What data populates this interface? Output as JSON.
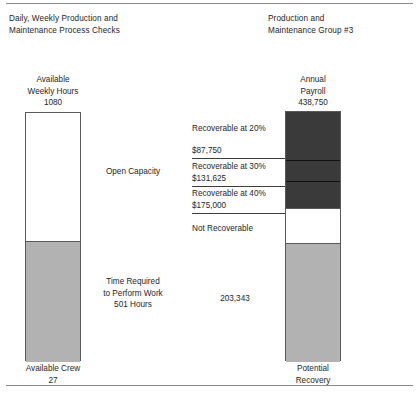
{
  "header": {
    "left_title": "Daily, Weekly Production and\nMaintenance Process Checks",
    "right_title": "Production and\nMaintenance Group #3"
  },
  "left_chart": {
    "top_caption": "Available\nWeekly Hours\n1080",
    "bottom_caption": "Available Crew\n27",
    "segments": [
      {
        "label": "Open Capacity",
        "fill": "#ffffff"
      },
      {
        "label": "Time Required\nto Perform Work\n501 Hours",
        "fill": "#b2b2b2"
      }
    ]
  },
  "right_chart": {
    "top_caption": "Annual\nPayroll\n438,750",
    "bottom_caption": "Potential\nRecovery",
    "inner_value": "203,343",
    "segments": [
      {
        "label": "Recoverable at 20%",
        "value": "$87,750",
        "fill": "#3a3a3a"
      },
      {
        "label": "Recoverable at 30%",
        "value": "$131,625",
        "fill": "#3a3a3a"
      },
      {
        "label": "Recoverable at 40%",
        "value": "$175,000",
        "fill": "#3a3a3a"
      },
      {
        "label": "Not Recoverable",
        "value": "",
        "fill": "#ffffff"
      },
      {
        "label": "",
        "value": "203,343",
        "fill": "#b2b2b2"
      }
    ]
  },
  "chart_data": {
    "type": "bar",
    "title": "Daily, Weekly Production and Maintenance Process Checks",
    "subtitle": "Production and Maintenance Group #3",
    "xlabel": "",
    "ylabel": "",
    "grid": false,
    "legend": "none",
    "series": [
      {
        "name": "Available Weekly Hours",
        "total": 1080,
        "total_label": "1080",
        "axis_caption_top": "Available Weekly Hours 1080",
        "axis_caption_bottom": "Available Crew 27",
        "crew": 27,
        "segments": [
          {
            "name": "Open Capacity",
            "value": 579,
            "color": "#ffffff"
          },
          {
            "name": "Time Required to Perform Work",
            "value": 501,
            "label": "501 Hours",
            "color": "#b2b2b2"
          }
        ]
      },
      {
        "name": "Annual Payroll",
        "total": 438750,
        "total_label": "438,750",
        "axis_caption_top": "Annual Payroll 438,750",
        "axis_caption_bottom": "Potential Recovery",
        "segments": [
          {
            "name": "Recoverable at 20%",
            "value": 87750,
            "label": "$87,750",
            "color": "#3a3a3a"
          },
          {
            "name": "Recoverable at 30%",
            "value": 43875,
            "label": "$131,625",
            "cumulative": 131625,
            "color": "#3a3a3a"
          },
          {
            "name": "Recoverable at 40%",
            "value": 43375,
            "label": "$175,000",
            "cumulative": 175000,
            "color": "#3a3a3a"
          },
          {
            "name": "Not Recoverable",
            "value": 60407,
            "label": "",
            "color": "#ffffff"
          },
          {
            "name": "Potential Recovery",
            "value": 203343,
            "label": "203,343",
            "color": "#b2b2b2"
          }
        ]
      }
    ]
  }
}
